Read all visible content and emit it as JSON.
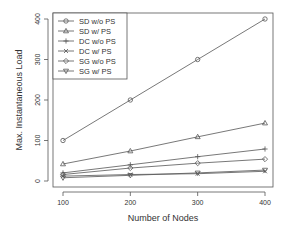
{
  "chart_data": {
    "type": "line",
    "title": "",
    "xlabel": "Number of Nodes",
    "ylabel": "Max. Instantaneous Load",
    "x": [
      100,
      200,
      300,
      400
    ],
    "xticks": [
      "100",
      "200",
      "300",
      "400"
    ],
    "yticks": [
      "0",
      "100",
      "200",
      "300",
      "400"
    ],
    "xlim": [
      88,
      412
    ],
    "ylim": [
      -15,
      415
    ],
    "grid": false,
    "legend_position": "top-left",
    "series": [
      {
        "name": "SD w/o PS",
        "marker": "circle",
        "values": [
          100,
          200,
          300,
          400
        ]
      },
      {
        "name": "SD w/ PS",
        "marker": "triangle",
        "values": [
          42,
          74,
          109,
          143
        ]
      },
      {
        "name": "DC w/o PS",
        "marker": "plus",
        "values": [
          20,
          40,
          60,
          79
        ]
      },
      {
        "name": "DC w/ PS",
        "marker": "cross",
        "values": [
          12,
          16,
          18,
          24
        ]
      },
      {
        "name": "SG w/o PS",
        "marker": "diamond",
        "values": [
          16,
          32,
          44,
          54
        ]
      },
      {
        "name": "SG w/ PS",
        "marker": "triangle-down",
        "values": [
          8,
          14,
          20,
          27
        ]
      }
    ]
  },
  "colors": {
    "line": "#555555",
    "axis": "#444444",
    "background": "#ffffff"
  }
}
